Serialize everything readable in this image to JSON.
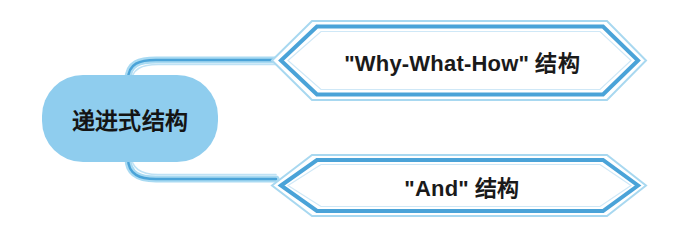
{
  "diagram": {
    "type": "mind-map",
    "background_color": "#ffffff",
    "root": {
      "label": "递进式结构",
      "shape": "rounded-rectangle",
      "fill_color": "#8fcdee",
      "text_color": "#141414"
    },
    "branches": [
      {
        "label": "\"Why-What-How\" 结构",
        "shape": "chevron",
        "border_color": "#4aa3d8",
        "outline_color": "#a8d8f0",
        "fill_color": "#ffffff",
        "text_color": "#1a1a1a"
      },
      {
        "label": "\"And\" 结构",
        "shape": "chevron",
        "border_color": "#4aa3d8",
        "outline_color": "#a8d8f0",
        "fill_color": "#ffffff",
        "text_color": "#1a1a1a"
      }
    ],
    "connectors": {
      "color": "#4aa3d8",
      "highlight_color": "#bfe2f5",
      "count": 2
    }
  }
}
